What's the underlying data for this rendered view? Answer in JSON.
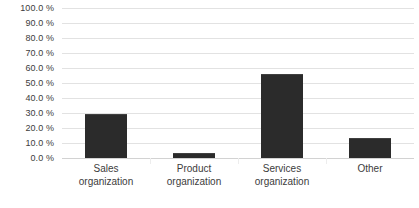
{
  "chart_data": {
    "type": "bar",
    "title": "",
    "xlabel": "",
    "ylabel": "",
    "categories": [
      "Sales organization",
      "Product organization",
      "Services organization",
      "Other"
    ],
    "category_lines": [
      [
        "Sales",
        "organization"
      ],
      [
        "Product",
        "organization"
      ],
      [
        "Services",
        "organization"
      ],
      [
        "Other"
      ]
    ],
    "values": [
      29.3,
      3.3,
      56.3,
      13.3
    ],
    "ylim": [
      0,
      100
    ],
    "ytick_values": [
      0,
      10,
      20,
      30,
      40,
      50,
      60,
      70,
      80,
      90,
      100
    ],
    "ytick_labels": [
      "0.0 %",
      "10.0 %",
      "20.0 %",
      "30.0 %",
      "40.0 %",
      "50.0 %",
      "60.0 %",
      "70.0 %",
      "80.0 %",
      "90.0 %",
      "100.0 %"
    ],
    "grid": true,
    "legend": false,
    "legend_position": "none",
    "bar_color": "#2b2b2b",
    "gridline_color": "#e2e2e2",
    "background_color": "#ffffff",
    "text_color": "#3c3c3c"
  }
}
